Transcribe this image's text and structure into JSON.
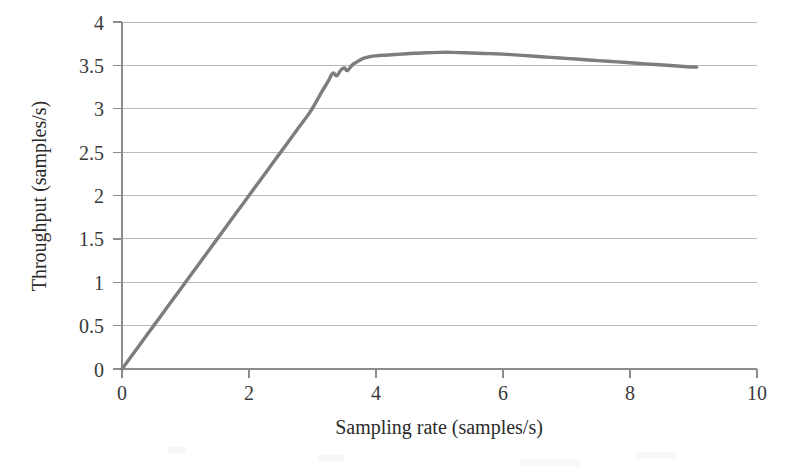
{
  "chart_data": {
    "type": "line",
    "title": "",
    "xlabel": "Sampling rate (samples/s)",
    "ylabel": "Throughput (samples/s)",
    "xlim": [
      0,
      10
    ],
    "ylim": [
      0,
      4
    ],
    "xticks": [
      "0",
      "2",
      "4",
      "6",
      "8",
      "10"
    ],
    "xtick_values": [
      0,
      2,
      4,
      6,
      8,
      10
    ],
    "yticks": [
      "0",
      "0.5",
      "1",
      "1.5",
      "2",
      "2.5",
      "3",
      "3.5",
      "4"
    ],
    "ytick_values": [
      0,
      0.5,
      1,
      1.5,
      2,
      2.5,
      3,
      3.5,
      4
    ],
    "grid": "horizontal",
    "legend": "none",
    "series": [
      {
        "name": "Throughput",
        "color": "#7d7d7d",
        "x": [
          0.0,
          0.2,
          0.4,
          0.6,
          0.8,
          1.0,
          1.2,
          1.4,
          1.6,
          1.8,
          2.0,
          2.2,
          2.4,
          2.6,
          2.8,
          2.95,
          3.05,
          3.15,
          3.25,
          3.32,
          3.38,
          3.44,
          3.5,
          3.55,
          3.62,
          3.7,
          3.8,
          3.9,
          4.0,
          4.2,
          4.4,
          4.6,
          4.8,
          5.0,
          5.2,
          5.4,
          5.6,
          5.8,
          6.0,
          6.3,
          6.6,
          6.9,
          7.2,
          7.5,
          7.8,
          8.1,
          8.4,
          8.7,
          8.9,
          9.05
        ],
        "y": [
          0.0,
          0.2,
          0.4,
          0.6,
          0.8,
          1.0,
          1.2,
          1.4,
          1.6,
          1.8,
          2.0,
          2.2,
          2.4,
          2.6,
          2.8,
          2.95,
          3.07,
          3.2,
          3.32,
          3.41,
          3.38,
          3.44,
          3.47,
          3.44,
          3.5,
          3.54,
          3.58,
          3.6,
          3.61,
          3.62,
          3.63,
          3.64,
          3.645,
          3.65,
          3.65,
          3.645,
          3.64,
          3.635,
          3.63,
          3.615,
          3.6,
          3.585,
          3.57,
          3.555,
          3.54,
          3.525,
          3.51,
          3.495,
          3.485,
          3.48
        ]
      }
    ]
  },
  "axes": {
    "y_axis_title": "Throughput (samples/s)",
    "x_axis_title": "Sampling rate (samples/s)"
  }
}
